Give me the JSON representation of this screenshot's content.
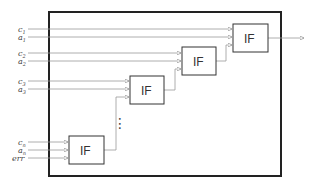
{
  "diagram": {
    "type": "cascaded IF blocks",
    "outer_box": {
      "stroke": "#222222"
    },
    "block_label": "IF",
    "blocks": [
      {
        "id": "if-1",
        "label": "IF"
      },
      {
        "id": "if-2",
        "label": "IF"
      },
      {
        "id": "if-3",
        "label": "IF"
      },
      {
        "id": "if-4",
        "label": "IF"
      }
    ],
    "inputs": [
      {
        "base": "c",
        "sub": "1"
      },
      {
        "base": "a",
        "sub": "1"
      },
      {
        "base": "c",
        "sub": "2"
      },
      {
        "base": "a",
        "sub": "2"
      },
      {
        "base": "c",
        "sub": "3"
      },
      {
        "base": "a",
        "sub": "3"
      },
      {
        "base": "c",
        "sub": "n"
      },
      {
        "base": "a",
        "sub": "n"
      },
      {
        "base": "err",
        "sub": ""
      }
    ],
    "ellipsis": "⋮",
    "line_color": "#999999"
  }
}
